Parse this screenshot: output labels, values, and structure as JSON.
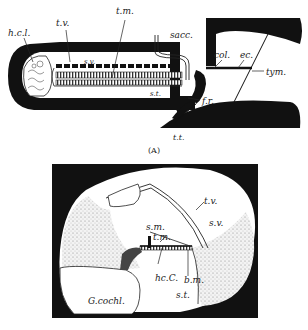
{
  "figure_a": {
    "caption": "(A)",
    "labels": {
      "hcl": "h.c.l.",
      "tv": "t.v.",
      "tm": "t.m.",
      "sv": "s.v.",
      "sacc": "sacc.",
      "col": "col.",
      "ec": "ec.",
      "tym": "tym.",
      "st": "s.t.",
      "fr": "f.r.",
      "tt": "t.t."
    }
  },
  "figure_b": {
    "labels": {
      "tv": "t.v.",
      "sv": "s.v.",
      "sm": "s.m.",
      "tm": "t.m.",
      "hcc": "hc.C.",
      "bm": "b.m.",
      "st": "s.t.",
      "gcochl": "G.cochl."
    }
  },
  "colors": {
    "ink": "#111111",
    "paper": "#ffffff",
    "stipple": "#e4e4e4"
  }
}
